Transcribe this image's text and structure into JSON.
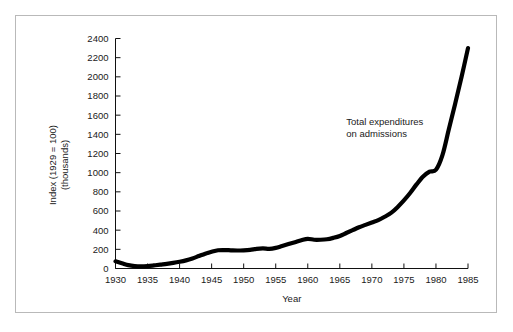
{
  "chart_data": {
    "type": "line",
    "title": "",
    "xlabel": "Year",
    "ylabel": "Index (1929 = 100) (thousands)",
    "ylabel_line1": "Index (1929 = 100)",
    "ylabel_line2": "(thousands)",
    "xlim": [
      1930,
      1985
    ],
    "ylim": [
      0,
      2400
    ],
    "grid": false,
    "legend_position": "none",
    "xticks": [
      1930,
      1935,
      1940,
      1945,
      1950,
      1955,
      1960,
      1965,
      1970,
      1975,
      1980,
      1985
    ],
    "xtick_labels": [
      "1930",
      "1935",
      "1940",
      "1945",
      "1950",
      "1955",
      "1960",
      "1965",
      "1970",
      "1975",
      "1980",
      "1985"
    ],
    "yticks": [
      0,
      200,
      400,
      600,
      800,
      1000,
      1200,
      1400,
      1600,
      1800,
      2000,
      2200,
      2400
    ],
    "ytick_labels": [
      "0",
      "200",
      "400",
      "600",
      "800",
      "1000",
      "1200",
      "1400",
      "1600",
      "1800",
      "2000",
      "2200",
      "2400"
    ],
    "annotations": [
      {
        "name": "series-annotation",
        "line1": "Total  expenditures",
        "line2": "on admissions",
        "x": 1966,
        "y": 1500
      }
    ],
    "series": [
      {
        "name": "Total expenditures on admissions",
        "color": "#000000",
        "x": [
          1930,
          1931,
          1932,
          1933,
          1934,
          1935,
          1936,
          1937,
          1938,
          1939,
          1940,
          1941,
          1942,
          1943,
          1944,
          1945,
          1946,
          1947,
          1948,
          1949,
          1950,
          1951,
          1952,
          1953,
          1954,
          1955,
          1956,
          1957,
          1958,
          1959,
          1960,
          1961,
          1962,
          1963,
          1964,
          1965,
          1966,
          1967,
          1968,
          1969,
          1970,
          1971,
          1972,
          1973,
          1974,
          1975,
          1976,
          1977,
          1978,
          1979,
          1980,
          1981,
          1982,
          1983,
          1984,
          1985
        ],
        "y": [
          75,
          55,
          35,
          25,
          22,
          25,
          32,
          40,
          48,
          58,
          70,
          85,
          105,
          130,
          155,
          175,
          190,
          192,
          190,
          188,
          190,
          195,
          205,
          210,
          205,
          215,
          235,
          255,
          275,
          295,
          310,
          300,
          300,
          305,
          320,
          340,
          370,
          400,
          430,
          455,
          480,
          505,
          540,
          580,
          640,
          710,
          790,
          880,
          960,
          1010,
          1030,
          1180,
          1450,
          1720,
          2000,
          2300
        ]
      }
    ]
  }
}
